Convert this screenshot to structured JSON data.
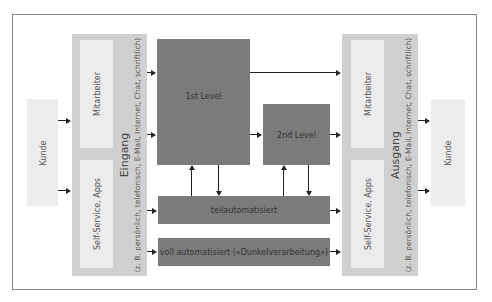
{
  "diagram": {
    "left_customer": {
      "label": "Kunde"
    },
    "right_customer": {
      "label": "Kunde"
    },
    "input_panel": {
      "title": "Eingang",
      "subtitle": "(z. B. persönlich, telefonisch, E-Mail, Internet, Chat, schriftlich)",
      "items": [
        {
          "label": "Mitarbeiter"
        },
        {
          "label": "Self-Service, Apps"
        }
      ]
    },
    "output_panel": {
      "title": "Ausgang",
      "subtitle": "(z. B. persönlich, telefonisch, E-Mail, Internet, Chat, schriftlich)",
      "items": [
        {
          "label": "Mitarbeiter"
        },
        {
          "label": "Self-Service, Apps"
        }
      ]
    },
    "processing": {
      "first_level": "1st Level",
      "second_level": "2nd Level",
      "semi_automated": "teilautomatisiert",
      "fully_automated": "voll automatisiert («Dunkelverarbeitung»)"
    },
    "colors": {
      "customer_box": "#ececec",
      "panel": "#d0d0d0",
      "inner_box": "#ececec",
      "process_box": "#7b7b7b",
      "arrow": "#222222",
      "frame": "#8a8a8a"
    }
  }
}
